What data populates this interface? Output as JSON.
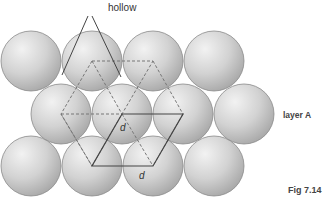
{
  "labels": {
    "hollow": "hollow",
    "layer": "layer  A",
    "figure": "Fig 7.14",
    "d1": "d",
    "d2": "d"
  },
  "spheres": {
    "radius": 30,
    "rows": [
      {
        "y": 61,
        "x": [
          31,
          92,
          153,
          214
        ]
      },
      {
        "y": 114,
        "x": [
          61,
          122,
          183,
          244
        ]
      },
      {
        "y": 166,
        "x": [
          31,
          92,
          153,
          214
        ]
      }
    ]
  },
  "colors": {
    "sphere_fill": "#d0d0d0",
    "sphere_stroke": "#8a8a8a",
    "line": "#444444",
    "dashed": "#777777"
  }
}
